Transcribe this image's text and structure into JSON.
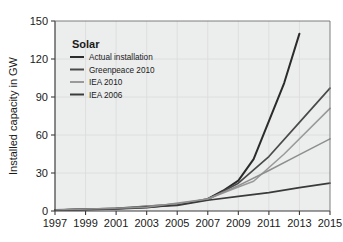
{
  "chart_data": {
    "type": "line",
    "title": "",
    "xlabel": "",
    "ylabel": "Installed capacity in GW",
    "xlim": [
      1997,
      2015
    ],
    "ylim": [
      0,
      150
    ],
    "grid": true,
    "legend_position": "inside-top-left",
    "legend_title": "Solar",
    "x_ticks": [
      "1997",
      "1999",
      "2001",
      "2003",
      "2005",
      "2007",
      "2009",
      "2011",
      "2013",
      "2015"
    ],
    "y_ticks": [
      "0",
      "30",
      "60",
      "90",
      "120",
      "150"
    ],
    "series": [
      {
        "name": "Actual installation",
        "color": "#2b2b2b",
        "width": 2.0,
        "x": [
          1997,
          1999,
          2001,
          2003,
          2005,
          2006,
          2007,
          2008,
          2009,
          2010,
          2011,
          2012,
          2013
        ],
        "values": [
          0.8,
          1.2,
          1.8,
          2.8,
          5.4,
          7.0,
          9.5,
          16.0,
          24.0,
          41.0,
          71.0,
          101.0,
          140.0
        ]
      },
      {
        "name": "Greenpeace 2010",
        "color": "#4a4a4a",
        "width": 1.7,
        "x": [
          1997,
          2001,
          2005,
          2007,
          2009,
          2011,
          2013,
          2015
        ],
        "values": [
          0.8,
          2.0,
          5.5,
          9.0,
          22.0,
          43.0,
          70.0,
          97.0
        ]
      },
      {
        "name": "IEA 2010",
        "color": "#9a9a9a",
        "width": 1.6,
        "x": [
          1997,
          2001,
          2005,
          2007,
          2009,
          2010,
          2012,
          2015
        ],
        "values": [
          0.8,
          2.0,
          5.5,
          9.5,
          19.0,
          23.5,
          45.0,
          81.0
        ]
      },
      {
        "name": "IEA 2006",
        "color": "#3a3a3a",
        "width": 1.7,
        "x": [
          1997,
          2001,
          2005,
          2007,
          2009,
          2011,
          2013,
          2015
        ],
        "values": [
          0.8,
          1.8,
          4.5,
          8.5,
          11.5,
          14.5,
          18.5,
          22.0
        ]
      },
      {
        "name": "unlabeled-mid-gray",
        "color": "#8e8e8e",
        "width": 1.5,
        "x": [
          1997,
          2003,
          2007,
          2009,
          2011,
          2013,
          2015
        ],
        "values": [
          0.8,
          3.0,
          9.5,
          20.0,
          32.0,
          44.5,
          57.0
        ]
      }
    ],
    "legend_entries": [
      {
        "label": "Actual installation",
        "color": "#2b2b2b"
      },
      {
        "label": "Greenpeace 2010",
        "color": "#4a4a4a"
      },
      {
        "label": "IEA 2010",
        "color": "#9a9a9a"
      },
      {
        "label": "IEA 2006",
        "color": "#3a3a3a"
      }
    ]
  },
  "style": {
    "plot_background": "#eceded",
    "grid_color": "#dcdddd",
    "axis_color": "#3d3d3d",
    "page_background": "#ffffff"
  }
}
